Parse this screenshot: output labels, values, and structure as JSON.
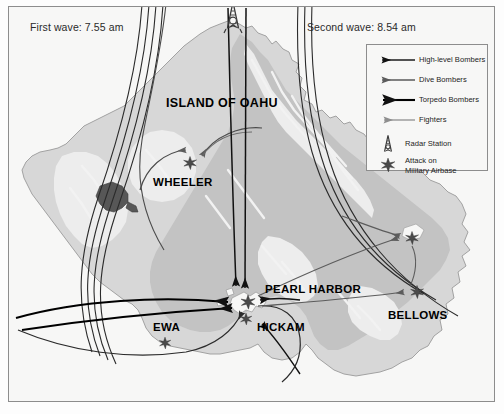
{
  "figure": {
    "title_visible": false,
    "background_color": "#f7f7f6",
    "frame_color": "#8d8d8d"
  },
  "annotations": {
    "first_wave": "First wave: 7.55 am",
    "second_wave": "Second wave: 8.54 am"
  },
  "places": [
    {
      "id": "oahu",
      "label": "ISLAND OF OAHU"
    },
    {
      "id": "wheeler",
      "label": "WHEELER"
    },
    {
      "id": "pearl",
      "label": "PEARL HARBOR"
    },
    {
      "id": "hickam",
      "label": "HICKAM"
    },
    {
      "id": "ewa",
      "label": "EWA"
    },
    {
      "id": "bellows",
      "label": "BELLOWS"
    }
  ],
  "legend": {
    "items": [
      {
        "id": "high-level-bombers",
        "label": "High-level Bombers",
        "symbol": "arrow-line",
        "color": "#1b1b1b",
        "weight": 1.3
      },
      {
        "id": "dive-bombers",
        "label": "Dive Bombers",
        "symbol": "arrow-line",
        "color": "#5a5a5a",
        "weight": 1.3
      },
      {
        "id": "torpedo-bombers",
        "label": "Torpedo Bombers",
        "symbol": "arrow-line",
        "color": "#000000",
        "weight": 2.1
      },
      {
        "id": "fighters",
        "label": "Fighters",
        "symbol": "arrow-line",
        "color": "#8e8e8e",
        "weight": 1.3
      },
      {
        "id": "radar-station",
        "label": "Radar Station",
        "symbol": "radar-tower-icon",
        "color": "#3a3a3a"
      },
      {
        "id": "attack-military-airbase",
        "label": "Attack on\nMilitary Airbase",
        "symbol": "attack-burst-icon",
        "color": "#3a3a3a"
      }
    ]
  },
  "map": {
    "colors": {
      "sea": "#f7f7f6",
      "lowland": "#d9d9d9",
      "midland": "#c4c4c4",
      "highland": "#efefef",
      "lake": "#585858",
      "coastline": "#9a9a9a"
    },
    "markers": [
      {
        "id": "radar-opana",
        "type": "radar-station",
        "x": 233,
        "y": 16
      },
      {
        "id": "attack-wheeler",
        "type": "attack-burst",
        "x": 190,
        "y": 163
      },
      {
        "id": "attack-kaneohe",
        "type": "attack-burst",
        "x": 412,
        "y": 238
      },
      {
        "id": "attack-bellows",
        "type": "attack-burst",
        "x": 417,
        "y": 292
      },
      {
        "id": "attack-pearl",
        "type": "attack-burst",
        "x": 247,
        "y": 303
      },
      {
        "id": "attack-hickam",
        "type": "attack-burst",
        "x": 245,
        "y": 318
      },
      {
        "id": "attack-ewa",
        "type": "attack-burst",
        "x": 165,
        "y": 343
      }
    ]
  }
}
